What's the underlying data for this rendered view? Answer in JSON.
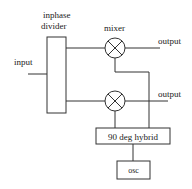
{
  "diagram": {
    "type": "block-diagram",
    "colors": {
      "line": "#333333",
      "text": "#222222",
      "background": "#ffffff"
    },
    "labels": {
      "divider_line1": "inphase",
      "divider_line2": "divider",
      "input": "input",
      "mixer": "mixer",
      "output_top": "output",
      "output_bottom": "output",
      "hybrid": "90 deg hybrid",
      "osc": "osc"
    },
    "blocks": [
      {
        "id": "divider",
        "label": "inphase divider"
      },
      {
        "id": "mixer-top",
        "label": "mixer",
        "symbol": "circle-x"
      },
      {
        "id": "mixer-bottom",
        "label": "",
        "symbol": "circle-x"
      },
      {
        "id": "hybrid",
        "label": "90 deg hybrid"
      },
      {
        "id": "osc",
        "label": "osc"
      }
    ],
    "connections": [
      {
        "from": "input",
        "to": "divider"
      },
      {
        "from": "divider",
        "to": "mixer-top"
      },
      {
        "from": "divider",
        "to": "mixer-bottom"
      },
      {
        "from": "mixer-top",
        "to": "output_top"
      },
      {
        "from": "mixer-bottom",
        "to": "output_bottom"
      },
      {
        "from": "hybrid",
        "to": "mixer-top"
      },
      {
        "from": "hybrid",
        "to": "mixer-bottom"
      },
      {
        "from": "osc",
        "to": "hybrid"
      }
    ]
  }
}
